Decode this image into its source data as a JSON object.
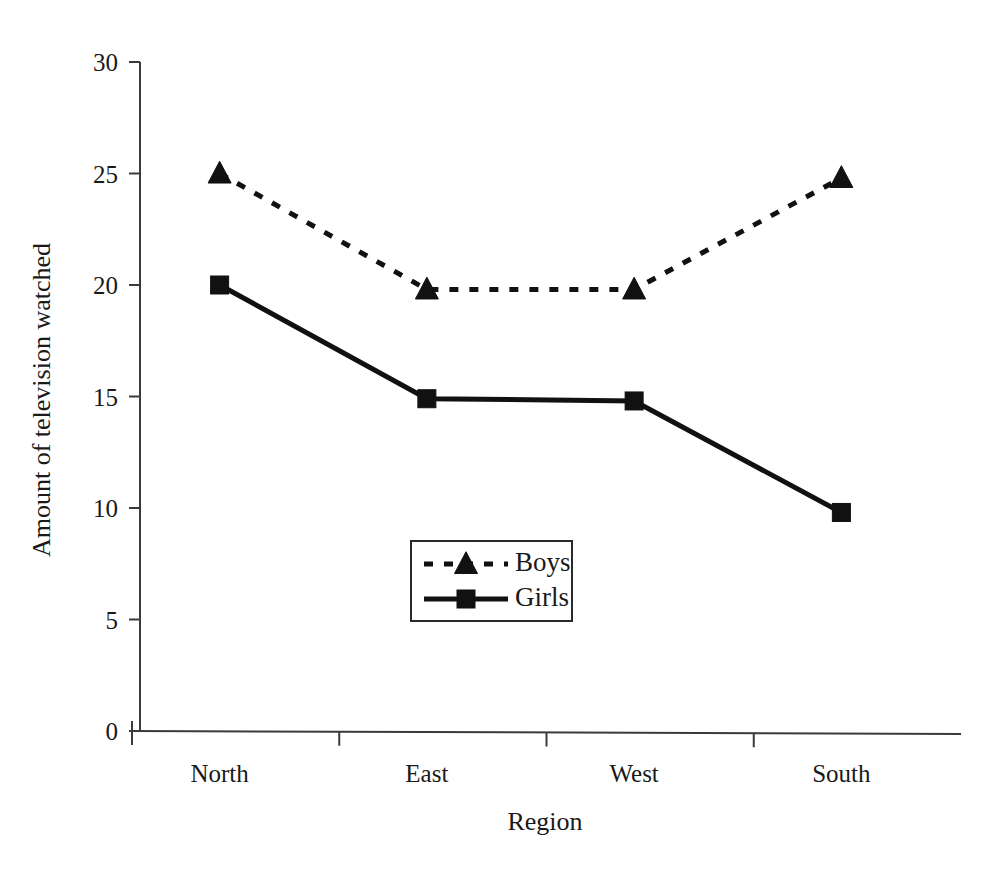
{
  "chart_data": {
    "type": "line",
    "title": "",
    "xlabel": "Region",
    "ylabel": "Amount of television watched",
    "categories": [
      "North",
      "East",
      "West",
      "South"
    ],
    "series": [
      {
        "name": "Boys",
        "values": [
          25.0,
          19.8,
          19.8,
          24.8
        ],
        "marker": "triangle",
        "line_style": "dotted",
        "color": "#111111"
      },
      {
        "name": "Girls",
        "values": [
          20.0,
          14.9,
          14.8,
          9.8
        ],
        "marker": "square",
        "line_style": "solid",
        "color": "#111111"
      }
    ],
    "ylim": [
      0,
      30
    ],
    "y_ticks": [
      0,
      5,
      10,
      15,
      20,
      25,
      30
    ],
    "y_tick_labels": [
      "0",
      "5",
      "10",
      "15",
      "20",
      "25",
      "30"
    ],
    "grid": false,
    "legend_position": "center",
    "background_color": "#ffffff"
  },
  "axes": {
    "y_title": "Amount of television watched",
    "x_title": "Region"
  },
  "legend": {
    "entries": [
      {
        "label": "Boys"
      },
      {
        "label": "Girls"
      }
    ]
  }
}
